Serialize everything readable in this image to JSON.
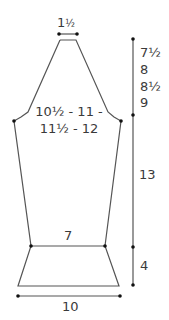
{
  "diagram": {
    "type": "knitting-schematic",
    "line_color": "#555555",
    "dot_color": "#111111",
    "text_color": "#3a3a3a",
    "labels": {
      "neck_width": {
        "whole": "1",
        "frac": "½"
      },
      "armhole_depth": [
        "7½",
        "8",
        "8½",
        "9"
      ],
      "chest_width_line1": "10½ - 11 -",
      "chest_width_line2": "11½ - 12",
      "body_length": "13",
      "waist_width": "7",
      "hem_depth": "4",
      "hem_width": "10"
    }
  }
}
